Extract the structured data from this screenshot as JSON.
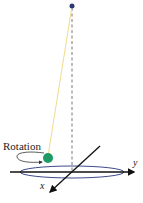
{
  "diagram": {
    "type": "conical-pendulum",
    "labels": {
      "rotation": "Rotation",
      "x_axis": "x",
      "y_axis": "y"
    },
    "colors": {
      "pivot": "#2a3a6e",
      "string": "#f0dc8c",
      "bob": "#1f9a64",
      "ellipse": "#3e4a8a",
      "axes": "#111111",
      "dashed_line": "#555555"
    }
  }
}
